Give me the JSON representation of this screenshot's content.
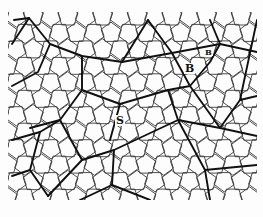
{
  "figure": {
    "labels": [
      {
        "id": "label-B-large",
        "text": "B",
        "x": 184,
        "y": 63,
        "size": 11
      },
      {
        "id": "label-B-small",
        "text": "B",
        "x": 204,
        "y": 48,
        "size": 8
      },
      {
        "id": "label-S",
        "text": "S",
        "x": 115,
        "y": 115,
        "size": 11
      }
    ],
    "colors": {
      "background": "#fdfdfd",
      "line": "#111111",
      "thin_line": "#3a3a3a"
    }
  }
}
